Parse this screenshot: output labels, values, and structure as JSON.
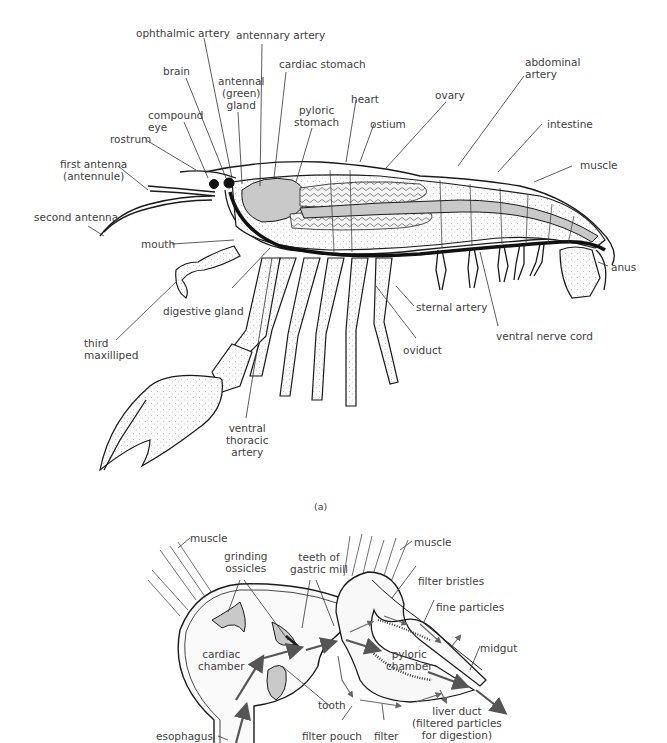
{
  "figure": {
    "panel_a_caption": "(a)",
    "colors": {
      "ink": "#1a1a1a",
      "label": "#404040",
      "tissue_grey": "#c9c9c9",
      "arrow": "#555555"
    }
  },
  "panel_a": {
    "title": "Crayfish internal anatomy (lateral view)",
    "labels": [
      {
        "id": "ophthalmic-artery",
        "text": "ophthalmic artery"
      },
      {
        "id": "antennary-artery",
        "text": "antennary artery"
      },
      {
        "id": "cardiac-stomach",
        "text": "cardiac stomach"
      },
      {
        "id": "brain",
        "text": "brain"
      },
      {
        "id": "antennal-green-gland",
        "text": "antennal\n(green)\ngland"
      },
      {
        "id": "pyloric-stomach",
        "text": "pyloric\nstomach"
      },
      {
        "id": "heart",
        "text": "heart"
      },
      {
        "id": "ostium",
        "text": "ostium"
      },
      {
        "id": "ovary",
        "text": "ovary"
      },
      {
        "id": "abdominal-artery",
        "text": "abdominal\nartery"
      },
      {
        "id": "intestine",
        "text": "intestine"
      },
      {
        "id": "muscle",
        "text": "muscle"
      },
      {
        "id": "compound-eye",
        "text": "compound\neye"
      },
      {
        "id": "rostrum",
        "text": "rostrum"
      },
      {
        "id": "first-antenna",
        "text": "first antenna\n(antennule)"
      },
      {
        "id": "second-antenna",
        "text": "second antenna"
      },
      {
        "id": "mouth",
        "text": "mouth"
      },
      {
        "id": "digestive-gland",
        "text": "digestive gland"
      },
      {
        "id": "third-maxilliped",
        "text": "third\nmaxilliped"
      },
      {
        "id": "ventral-thoracic-artery",
        "text": "ventral\nthoracic\nartery"
      },
      {
        "id": "sternal-artery",
        "text": "sternal artery"
      },
      {
        "id": "oviduct",
        "text": "oviduct"
      },
      {
        "id": "ventral-nerve-cord",
        "text": "ventral nerve cord"
      },
      {
        "id": "anus",
        "text": "anus"
      }
    ]
  },
  "panel_b": {
    "title": "Crayfish stomach (gastric mill) cross-section",
    "labels": [
      {
        "id": "muscle-left",
        "text": "muscle"
      },
      {
        "id": "muscle-right",
        "text": "muscle"
      },
      {
        "id": "grinding-ossicles",
        "text": "grinding\nossicles"
      },
      {
        "id": "teeth-of-gastric-mill",
        "text": "teeth of\ngastric mill"
      },
      {
        "id": "filter-bristles",
        "text": "filter bristles"
      },
      {
        "id": "fine-particles",
        "text": "fine particles"
      },
      {
        "id": "cardiac-chamber",
        "text": "cardiac\nchamber"
      },
      {
        "id": "pyloric-chamber",
        "text": "pyloric\nchamber"
      },
      {
        "id": "midgut",
        "text": "midgut"
      },
      {
        "id": "tooth",
        "text": "tooth"
      },
      {
        "id": "liver-duct",
        "text": "liver duct\n(filtered particles\nfor digestion)"
      },
      {
        "id": "esophagus",
        "text": "esophagus"
      },
      {
        "id": "filter-pouch",
        "text": "filter pouch"
      },
      {
        "id": "filter",
        "text": "filter"
      }
    ]
  }
}
